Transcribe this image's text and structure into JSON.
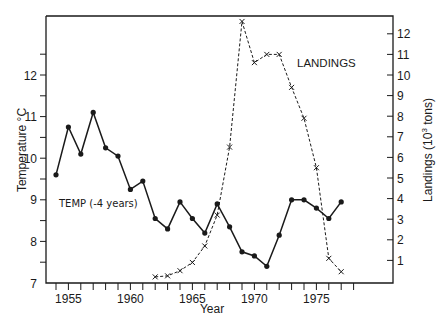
{
  "chart_data": {
    "type": "line",
    "title": "",
    "xlabel": "Year",
    "ylabel": "Temperature °C",
    "y2label": "Landings (10³ tons)",
    "xlim": [
      1953.8,
      1980.8
    ],
    "ylim": [
      7,
      13.3
    ],
    "y2lim": [
      0,
      12.8
    ],
    "x_ticks": [
      1954,
      1955,
      1956,
      1957,
      1958,
      1959,
      1960,
      1961,
      1962,
      1963,
      1964,
      1965,
      1966,
      1967,
      1968,
      1969,
      1970,
      1971,
      1972,
      1973,
      1974,
      1975,
      1976,
      1977,
      1978
    ],
    "x_tick_labels": [
      {
        "year": 1955,
        "label": "1955"
      },
      {
        "year": 1960,
        "label": "1960"
      },
      {
        "year": 1965,
        "label": "1965"
      },
      {
        "year": 1970,
        "label": "1970"
      },
      {
        "year": 1975,
        "label": "1975"
      }
    ],
    "y_ticks": [
      7,
      7.5,
      8,
      8.5,
      9,
      9.5,
      10,
      10.5,
      11,
      11.5,
      12,
      12.5
    ],
    "y_tick_labels": [
      "7",
      "8",
      "9",
      "10",
      "11",
      "12"
    ],
    "y2_ticks": [
      1,
      2,
      3,
      4,
      5,
      6,
      7,
      8,
      9,
      10,
      11,
      12
    ],
    "y2_tick_labels": [
      "1",
      "2",
      "3",
      "4",
      "5",
      "6",
      "7",
      "8",
      "9",
      "10",
      "11",
      "12"
    ],
    "grid": false,
    "legend": "inline annotations",
    "series": [
      {
        "name": "TEMP (-4 years)",
        "axis": "left",
        "style": "solid line, filled circle markers",
        "x": [
          1954,
          1955,
          1956,
          1957,
          1958,
          1959,
          1960,
          1961,
          1962,
          1963,
          1964,
          1965,
          1966,
          1967,
          1968,
          1969,
          1970,
          1971,
          1972,
          1973,
          1974,
          1975,
          1976,
          1977
        ],
        "values": [
          9.6,
          10.75,
          10.1,
          11.1,
          10.25,
          10.05,
          9.25,
          9.45,
          8.55,
          8.3,
          8.95,
          8.55,
          8.2,
          8.9,
          8.35,
          7.75,
          7.65,
          7.4,
          8.15,
          9.0,
          9.0,
          8.8,
          8.55,
          8.95
        ]
      },
      {
        "name": "LANDINGS",
        "axis": "right",
        "style": "dashed line, x markers",
        "x": [
          1962,
          1963,
          1964,
          1965,
          1966,
          1967,
          1968,
          1969,
          1970,
          1971,
          1972,
          1973,
          1974,
          1975,
          1976,
          1977
        ],
        "values": [
          0.2,
          0.25,
          0.5,
          0.9,
          1.7,
          3.2,
          6.5,
          12.6,
          10.6,
          11.0,
          11.0,
          9.4,
          7.9,
          5.5,
          1.1,
          0.45
        ]
      }
    ],
    "annotations": [
      {
        "text": "TEMP (-4 years)",
        "near_series": "TEMP (-4 years)"
      },
      {
        "text": "LANDINGS",
        "near_series": "LANDINGS"
      }
    ]
  },
  "labels": {
    "xlabel": "Year",
    "ylabel": "Temperature °C",
    "y2label_prefix": "Landings (10",
    "y2label_sup": "3",
    "y2label_suffix": " tons)",
    "temp_annotation": "TEMP (-4 years)",
    "landings_annotation": "LANDINGS"
  }
}
